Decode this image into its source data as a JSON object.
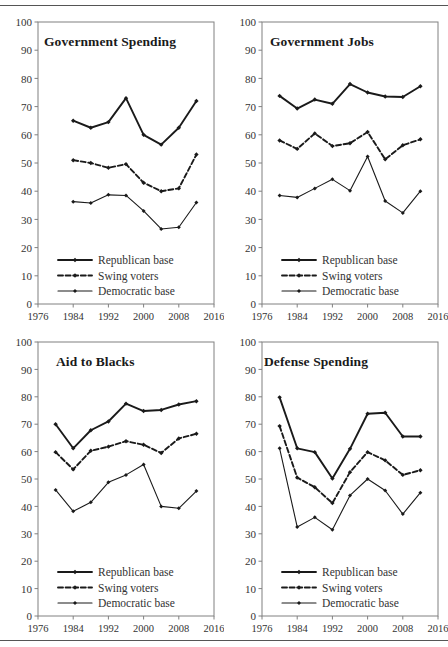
{
  "figure": {
    "background": "#ffffff",
    "line_color": "#1a1a1a",
    "axis_color": "#808080",
    "tick_label_color": "#333333"
  },
  "axes": {
    "y_ticks": [
      0,
      10,
      20,
      30,
      40,
      50,
      60,
      70,
      80,
      90,
      100
    ],
    "x_ticks": [
      1976,
      1984,
      1992,
      2000,
      2008,
      2016
    ],
    "xlim": [
      1976,
      2016
    ],
    "ylim": [
      0,
      100
    ]
  },
  "legend": {
    "position": "bottom-left-inside",
    "entries": [
      {
        "label": "Republican base",
        "style": "solid-bold",
        "marker": "diamond"
      },
      {
        "label": "Swing voters",
        "style": "dashed-bold",
        "marker": "diamond"
      },
      {
        "label": "Democratic base",
        "style": "solid-thin",
        "marker": "diamond"
      }
    ]
  },
  "chart_data": [
    {
      "type": "line",
      "title": "Government Spending",
      "xlabel": "",
      "ylabel": "",
      "xlim": [
        1976,
        2016
      ],
      "ylim": [
        0,
        100
      ],
      "grid": false,
      "legend_position": "lower left",
      "x": [
        1984,
        1988,
        1992,
        1996,
        2000,
        2004,
        2008,
        2012
      ],
      "series": [
        {
          "name": "Republican base",
          "values": [
            65.0,
            62.5,
            64.5,
            73.0,
            60.0,
            56.5,
            62.5,
            72.0
          ]
        },
        {
          "name": "Swing voters",
          "values": [
            51.0,
            50.0,
            48.3,
            49.6,
            43.0,
            40.0,
            41.0,
            53.0
          ]
        },
        {
          "name": "Democratic base",
          "values": [
            36.3,
            35.8,
            38.7,
            38.5,
            33.0,
            26.6,
            27.2,
            36.0
          ]
        }
      ]
    },
    {
      "type": "line",
      "title": "Government Jobs",
      "xlabel": "",
      "ylabel": "",
      "xlim": [
        1976,
        2016
      ],
      "ylim": [
        0,
        100
      ],
      "grid": false,
      "legend_position": "lower left",
      "x": [
        1980,
        1984,
        1988,
        1992,
        1996,
        2000,
        2004,
        2008,
        2012
      ],
      "series": [
        {
          "name": "Republican base",
          "values": [
            73.8,
            69.3,
            72.5,
            71.0,
            78.0,
            75.0,
            73.6,
            73.4,
            77.2
          ]
        },
        {
          "name": "Swing voters",
          "values": [
            58.0,
            55.0,
            60.5,
            56.0,
            57.0,
            61.0,
            51.3,
            56.3,
            58.4
          ]
        },
        {
          "name": "Democratic base",
          "values": [
            38.5,
            37.8,
            41.0,
            44.2,
            40.2,
            52.3,
            36.5,
            32.3,
            40.0
          ]
        }
      ]
    },
    {
      "type": "line",
      "title": "Aid to Blacks",
      "xlabel": "",
      "ylabel": "",
      "xlim": [
        1976,
        2016
      ],
      "ylim": [
        0,
        100
      ],
      "grid": false,
      "legend_position": "lower left",
      "x": [
        1980,
        1984,
        1988,
        1992,
        1996,
        2000,
        2004,
        2008,
        2012
      ],
      "series": [
        {
          "name": "Republican base",
          "values": [
            70.0,
            61.2,
            67.8,
            71.0,
            77.5,
            74.8,
            75.2,
            77.2,
            78.4
          ]
        },
        {
          "name": "Swing voters",
          "values": [
            59.8,
            53.5,
            60.3,
            61.8,
            63.8,
            62.5,
            59.5,
            64.8,
            66.5
          ]
        },
        {
          "name": "Democratic base",
          "values": [
            46.0,
            38.2,
            41.5,
            48.8,
            51.5,
            55.3,
            40.0,
            39.3,
            45.6
          ]
        }
      ]
    },
    {
      "type": "line",
      "title": "Defense Spending",
      "xlabel": "",
      "ylabel": "",
      "xlim": [
        1976,
        2016
      ],
      "ylim": [
        0,
        100
      ],
      "grid": false,
      "legend_position": "lower left",
      "x": [
        1980,
        1984,
        1988,
        1992,
        1996,
        2000,
        2004,
        2008,
        2012
      ],
      "series": [
        {
          "name": "Republican base",
          "values": [
            79.8,
            61.2,
            59.8,
            50.2,
            61.0,
            73.8,
            74.2,
            65.5,
            65.5
          ]
        },
        {
          "name": "Swing voters",
          "values": [
            69.3,
            50.5,
            47.0,
            41.2,
            52.5,
            59.8,
            56.8,
            51.5,
            53.2
          ]
        },
        {
          "name": "Democratic base",
          "values": [
            61.2,
            32.5,
            36.0,
            31.5,
            44.0,
            50.0,
            45.8,
            37.2,
            45.0
          ]
        }
      ]
    }
  ]
}
